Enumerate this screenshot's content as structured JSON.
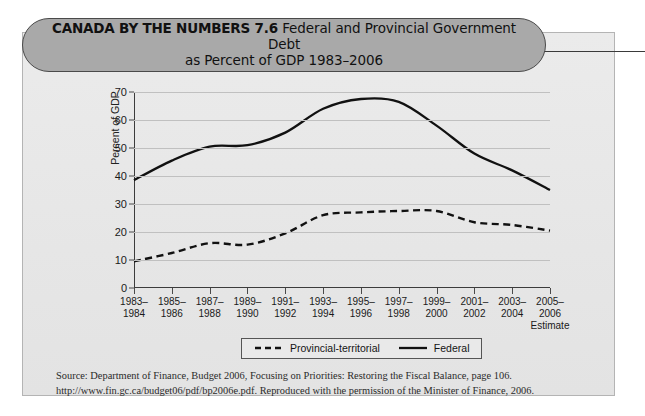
{
  "figure": {
    "kicker": "CANADA BY THE NUMBERS 7.6",
    "title_line1": "Federal and Provincial Government Debt",
    "title_line2": "as Percent of GDP 1983–2006"
  },
  "source": {
    "line1": "Source: Department of Finance, Budget 2006, Focusing on Priorities: Restoring the Fiscal Balance, page 106.",
    "line2": "http://www.fin.gc.ca/budget06/pdf/bp2006e.pdf. Reproduced with the permission of the Minister of Finance, 2006."
  },
  "legend": {
    "items": [
      {
        "label": "Provincial-territorial",
        "style": "dashed",
        "color": "#111111"
      },
      {
        "label": "Federal",
        "style": "solid",
        "color": "#111111"
      }
    ]
  },
  "axis_note": "Estimate",
  "colors": {
    "panel_background": "#e9e9e9",
    "panel_border": "#b4b4b4",
    "title_pill_fill": "#a9a9a9",
    "title_pill_border": "#4a4a4a",
    "gridline": "#c0c0c0",
    "axis": "#3c3c3c",
    "series": "#111111"
  },
  "chart_data": {
    "type": "line",
    "title": "Federal and Provincial Government Debt as Percent of GDP 1983–2006",
    "xlabel": "",
    "ylabel": "Percent of GDP",
    "ylim": [
      0,
      70
    ],
    "yticks": [
      0,
      10,
      20,
      30,
      40,
      50,
      60,
      70
    ],
    "grid": true,
    "legend_position": "bottom",
    "categories": [
      "1983–1984",
      "1985–1986",
      "1987–1988",
      "1989–1990",
      "1991–1992",
      "1993–1994",
      "1995–1996",
      "1997–1998",
      "1999–2000",
      "2001–2002",
      "2003–2004",
      "2005–2006"
    ],
    "category_lines": [
      [
        "1983–",
        "1984"
      ],
      [
        "1985–",
        "1986"
      ],
      [
        "1987–",
        "1988"
      ],
      [
        "1989–",
        "1990"
      ],
      [
        "1991–",
        "1992"
      ],
      [
        "1993–",
        "1994"
      ],
      [
        "1995–",
        "1996"
      ],
      [
        "1997–",
        "1998"
      ],
      [
        "1999–",
        "2000"
      ],
      [
        "2001–",
        "2002"
      ],
      [
        "2003–",
        "2004"
      ],
      [
        "2005–",
        "2006"
      ]
    ],
    "series": [
      {
        "name": "Federal",
        "style": "solid",
        "color": "#111111",
        "values": [
          38.5,
          45.5,
          50.5,
          51.0,
          55.5,
          64.0,
          67.5,
          66.5,
          58.0,
          48.0,
          42.0,
          35.0
        ]
      },
      {
        "name": "Provincial-territorial",
        "style": "dashed",
        "color": "#111111",
        "values": [
          9.5,
          12.5,
          16.0,
          15.5,
          19.5,
          26.0,
          27.0,
          27.5,
          27.5,
          23.5,
          22.5,
          20.5
        ]
      }
    ]
  }
}
